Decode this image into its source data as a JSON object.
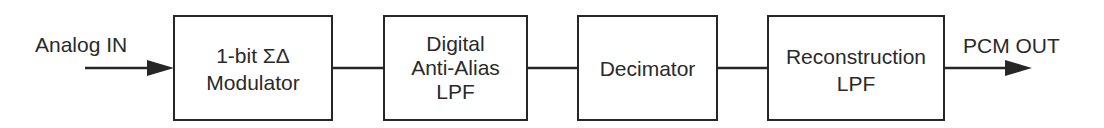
{
  "diagram": {
    "type": "signal-flow-block-diagram",
    "input_label": "Analog IN",
    "output_label": "PCM OUT",
    "blocks": [
      {
        "id": "modulator",
        "lines": [
          "1-bit ΣΔ",
          "Modulator"
        ]
      },
      {
        "id": "anti-alias-lpf",
        "lines": [
          "Digital",
          "Anti-Alias",
          "LPF"
        ]
      },
      {
        "id": "decimator",
        "lines": [
          "Decimator"
        ]
      },
      {
        "id": "reconstruction-lpf",
        "lines": [
          "Reconstruction",
          "LPF"
        ]
      }
    ],
    "connections": [
      {
        "from": "Analog IN",
        "to": "modulator",
        "arrow": true
      },
      {
        "from": "modulator",
        "to": "anti-alias-lpf",
        "arrow": false
      },
      {
        "from": "anti-alias-lpf",
        "to": "decimator",
        "arrow": false
      },
      {
        "from": "decimator",
        "to": "reconstruction-lpf",
        "arrow": false
      },
      {
        "from": "reconstruction-lpf",
        "to": "PCM OUT",
        "arrow": true
      }
    ],
    "colors": {
      "stroke": "#262626",
      "text": "#2a2a2a",
      "background": "#ffffff"
    }
  }
}
